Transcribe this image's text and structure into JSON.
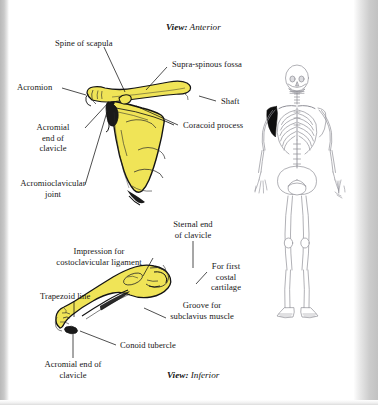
{
  "page": {
    "kind": "scanned-textbook-plate",
    "background_color": "#ffffff",
    "scan_edge_color": "#c4c4c4",
    "bone_fill_color": "#f0e457",
    "bone_outline_color": "#1a1a1a",
    "skeleton_line_color": "#8e8e96",
    "highlight_color": "#101010"
  },
  "figures": [
    {
      "id": "scapula-clavicle-anterior",
      "view_caption_prefix": "View:",
      "view_caption_value": "Anterior",
      "labels": [
        {
          "id": "spine-of-scapula",
          "text": "Spine of scapula"
        },
        {
          "id": "supra-spinous-fossa",
          "text": "Supra-spinous fossa"
        },
        {
          "id": "acromion",
          "text": "Acromion"
        },
        {
          "id": "shaft",
          "text": "Shaft"
        },
        {
          "id": "coracoid-process",
          "text": "Coracoid process"
        },
        {
          "id": "acromial-end-clavicle",
          "text": "Acromial\nend of\nclavicle"
        },
        {
          "id": "acromioclavicular-joint",
          "text": "Acromioclavicular\njoint"
        }
      ]
    },
    {
      "id": "clavicle-inferior",
      "view_caption_prefix": "View:",
      "view_caption_value": "Inferior",
      "labels": [
        {
          "id": "sternal-end-clavicle",
          "text": "Sternal end\nof clavicle"
        },
        {
          "id": "impression-costoclavicular",
          "text": "Impression for\ncostoclavicular ligament"
        },
        {
          "id": "for-first-costal-cartilage",
          "text": "For first\ncostal\ncartilage"
        },
        {
          "id": "trapezoid-line",
          "text": "Trapezoid line"
        },
        {
          "id": "groove-subclavius",
          "text": "Groove for\nsubclavius muscle"
        },
        {
          "id": "conoid-tubercle",
          "text": "Conoid tubercle"
        },
        {
          "id": "acromial-end-clavicle-inferior",
          "text": "Acromial end of\nclavicle"
        }
      ]
    },
    {
      "id": "skeleton-reference",
      "description": "anterior full skeleton with left pectoral girdle highlighted"
    }
  ]
}
